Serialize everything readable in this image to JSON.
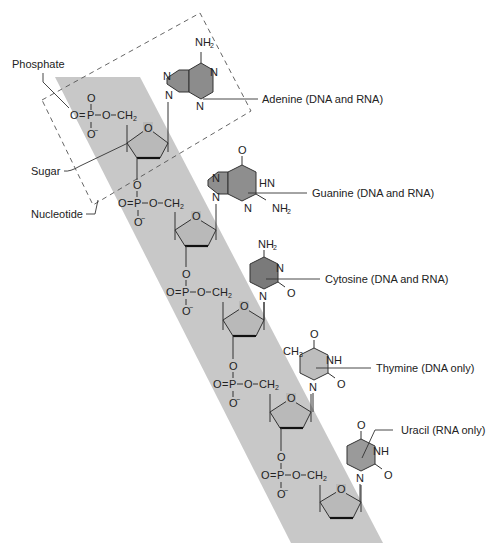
{
  "colors": {
    "background": "#ffffff",
    "backbone_band": "#c8c8c8",
    "purine_fill": "#8a8a8a",
    "adenine_fill": "#8c8c8c",
    "guanine_fill": "#8e8e8e",
    "cytosine_fill": "#7a7a7a",
    "thymine_fill": "#bdbdbd",
    "uracil_fill": "#9a9a9a",
    "sugar_fill": "#b9b9b9",
    "line": "#333333"
  },
  "labels": {
    "phosphate": "Phosphate",
    "sugar": "Sugar",
    "nucleotide": "Nucleotide",
    "adenine": "Adenine (DNA and RNA)",
    "guanine": "Guanine (DNA and RNA)",
    "cytosine": "Cytosine (DNA and RNA)",
    "thymine": "Thymine (DNA only)",
    "uracil": "Uracil (RNA only)"
  },
  "atoms": {
    "O": "O",
    "P": "P",
    "N": "N",
    "HN": "HN",
    "NH": "NH",
    "NH2": "NH",
    "NH2_sub": "2",
    "CH2": "CH",
    "CH2_sub": "2",
    "CH3": "CH",
    "CH3_sub": "3",
    "Ominus": "O",
    "minus": "−",
    "eq": "="
  },
  "nucleotides": [
    {
      "base": "Adenine",
      "availability": "DNA and RNA"
    },
    {
      "base": "Guanine",
      "availability": "DNA and RNA"
    },
    {
      "base": "Cytosine",
      "availability": "DNA and RNA"
    },
    {
      "base": "Thymine",
      "availability": "DNA only"
    },
    {
      "base": "Uracil",
      "availability": "RNA only"
    }
  ]
}
